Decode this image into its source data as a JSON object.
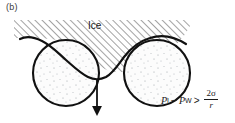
{
  "figure": {
    "panel_label": "(b)",
    "ice_label": "Ice",
    "arrow_direction": "down",
    "colors": {
      "outline": "#1a1a1a",
      "hatch": "#555555",
      "grain_fill": "#fbfbfb",
      "stipple": "#9aa0a6",
      "text": "#1a1a1a",
      "panel_label": "#3a3a3a",
      "background": "#ffffff"
    }
  },
  "formula": {
    "pressure_ice": "P",
    "pressure_ice_sub": "I",
    "minus": "−",
    "pressure_water": "P",
    "pressure_water_sub": "W",
    "relation": ">",
    "numerator": "2σ",
    "denominator": "r",
    "plain_text": "P_I − P_W > 2σ/r"
  }
}
